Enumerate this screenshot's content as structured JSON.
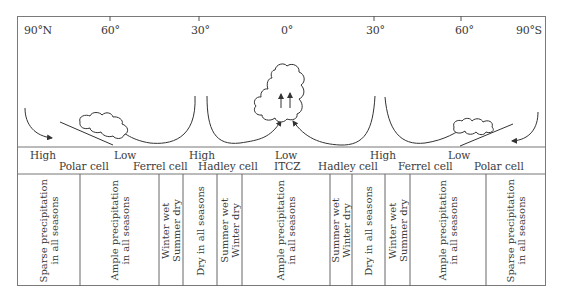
{
  "latitudes": [
    {
      "label": "90°N",
      "x": 24
    },
    {
      "label": "60°",
      "x": 101
    },
    {
      "label": "30°",
      "x": 191
    },
    {
      "label": "0°",
      "x": 276
    },
    {
      "label": "30°",
      "x": 366
    },
    {
      "label": "60°",
      "x": 456
    },
    {
      "label": "90°S",
      "x": 516
    }
  ],
  "pressure_labels": [
    {
      "label": "High",
      "x": 30,
      "y": 150
    },
    {
      "label": "Low",
      "x": 114,
      "y": 150
    },
    {
      "label": "High",
      "x": 189,
      "y": 150
    },
    {
      "label": "Low",
      "x": 275,
      "y": 150
    },
    {
      "label": "ITCZ",
      "x": 274,
      "y": 161
    },
    {
      "label": "High",
      "x": 370,
      "y": 150
    },
    {
      "label": "Low",
      "x": 448,
      "y": 150
    }
  ],
  "cell_labels": [
    {
      "label": "Polar cell",
      "x": 59,
      "y": 161
    },
    {
      "label": "Ferrel cell",
      "x": 133,
      "y": 161
    },
    {
      "label": "Hadley cell",
      "x": 198,
      "y": 161
    },
    {
      "label": "Hadley cell",
      "x": 318,
      "y": 161
    },
    {
      "label": "Ferrel cell",
      "x": 398,
      "y": 161
    },
    {
      "label": "Polar cell",
      "x": 474,
      "y": 161
    }
  ],
  "precipitation_zones": [
    {
      "line1": "Sparse precipitation",
      "line2": "in all seasons",
      "left": 17,
      "width": 63
    },
    {
      "line1": "Ample precipitation",
      "line2": "in all seasons",
      "left": 80,
      "width": 79
    },
    {
      "line1": "Winter wet",
      "line2": "Summer dry",
      "left": 159,
      "width": 24
    },
    {
      "line1": "Dry in all seasons",
      "line2": "",
      "left": 183,
      "width": 34
    },
    {
      "line1": "Summer wet",
      "line2": "Winter dry",
      "left": 217,
      "width": 25
    },
    {
      "line1": "Ample precipitation",
      "line2": "in all seasons",
      "left": 242,
      "width": 88
    },
    {
      "line1": "Summer wet",
      "line2": "Winter dry",
      "left": 330,
      "width": 22
    },
    {
      "line1": "Dry in all seasons",
      "line2": "",
      "left": 352,
      "width": 33
    },
    {
      "line1": "Winter wet",
      "line2": "Summer dry",
      "left": 385,
      "width": 25
    },
    {
      "line1": "Ample precipitation",
      "line2": "in all seasons",
      "left": 410,
      "width": 76
    },
    {
      "line1": "Sparse precipitation",
      "line2": "in all seasons",
      "left": 486,
      "width": 60
    }
  ]
}
